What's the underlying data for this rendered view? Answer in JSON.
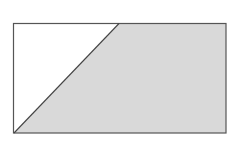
{
  "diagram": {
    "type": "geometry",
    "rectangle": {
      "x": 13.5,
      "y": 23.5,
      "width": 212.5,
      "height": 109.5
    },
    "diagonal": {
      "x1": 14,
      "y1": 133,
      "x2": 119,
      "y2": 23.5
    },
    "shaded_region": {
      "points": "14,133 119,23.5 226,23.5 226,133"
    },
    "colors": {
      "background": "#ffffff",
      "shade": "#d9d9d9",
      "stroke": "#555555",
      "unshaded": "#ffffff"
    }
  }
}
